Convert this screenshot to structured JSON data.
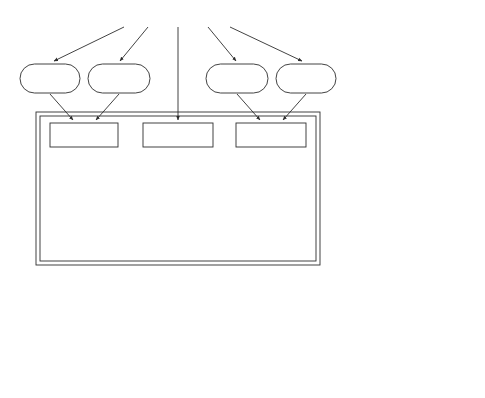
{
  "inputs": {
    "intake_k": {
      "arrow": "↓",
      "line1": "Intake",
      "line2": "of K",
      "sup": "+"
    },
    "loss_kcl": {
      "line1": "Loss of",
      "line2": "Gastric KCl"
    },
    "loss_nacl": {
      "line1": "Loss of",
      "line2": "Gastric NaCl"
    },
    "intake_na": {
      "arrow": "↓",
      "line1": "Intake",
      "line2": "of Na",
      "sup": "+"
    }
  },
  "core_boxes": {
    "k_deficiency": {
      "prefix": "K",
      "sup": "+",
      "text": " DEFICIENCY"
    },
    "loss_gastric_hcl": {
      "line1": "LOSS OF",
      "line2": "GASTRIC HCl"
    },
    "contraction_ecf": {
      "line1": "CONTRACTION",
      "line2": "OF ECF"
    },
    "metabolic_alkalosis": {
      "line1": "METABOLIC",
      "line2": "ALKALOSIS"
    }
  },
  "left_chain": {
    "p_k": {
      "arrow": "↓",
      "text": "P",
      "sub": "K+"
    },
    "shift_k_out": {
      "line1": "Shift of K",
      "sup": "+",
      "line2": "out of cells"
    },
    "shift_h_in": {
      "line1": "? Shift of H",
      "sup": "+",
      "line2": "into cells ?"
    },
    "abs_reabsorption": {
      "arrow": "↑",
      "italic": "absolute",
      "rest": " reabsorption",
      "line2": "of filtered HCO",
      "sub": "3",
      "sup2": "-"
    }
  },
  "right_chain": {
    "preferential": {
      "line1": "Preferential",
      "arrow": "↑",
      "text": "P",
      "sub": "HCO3-"
    },
    "shift_na_in": {
      "line1": "Shift of Na",
      "sup": "+",
      "line2": "into Cells"
    },
    "shift_k_out_right": {
      "line1": "Shift of K",
      "sup": "+",
      "line2": "out of cells"
    },
    "aldosterone": {
      "arrow": "↑",
      "text": "Aldosterone"
    },
    "renal_secretion_right": {
      "arrow": "↑",
      "line1": "renal tubular",
      "line2": "secretion of K",
      "sup": "+"
    }
  },
  "bottom_chain": {
    "filtered_load": {
      "arrow": "↑",
      "line1": "filtered load",
      "line2": "of NaHCO",
      "sub": "3"
    },
    "fractional": {
      "arrow": "↓",
      "italic": "fractional",
      "rest": " reabsorption",
      "line2": "of NaHCO",
      "sub": "3"
    },
    "renal_secretion_left": {
      "arrow": "↑",
      "line1": "renal tubular",
      "line2": "secretion of K",
      "sup": "+"
    },
    "urinary_khco3": {
      "arrow": "↑",
      "line1": "Urinary Excretion",
      "line2": "of KHCO",
      "sub": "3"
    },
    "urinary_nahco3": {
      "arrow": "↑",
      "line1": "Urinary Excretion",
      "line2": "of NaHCO",
      "sub": "3"
    }
  }
}
